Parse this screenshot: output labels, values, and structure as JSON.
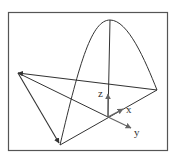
{
  "diagram": {
    "type": "3d-coordinate-sketch",
    "axes": {
      "x_label": "x",
      "y_label": "y",
      "z_label": "z"
    },
    "colors": {
      "line": "#333333",
      "frame": "#555555",
      "background": "#ffffff",
      "axis_arrow": "#666666"
    }
  }
}
